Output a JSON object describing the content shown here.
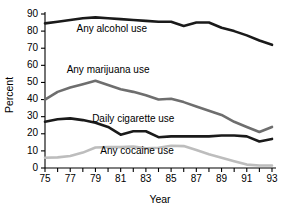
{
  "chart_data": {
    "type": "line",
    "title": "",
    "xlabel": "Year",
    "ylabel": "Percent",
    "xlim": [
      75,
      93
    ],
    "ylim": [
      0,
      90
    ],
    "ytick_labels": [
      "0",
      "10",
      "20",
      "30",
      "40",
      "50",
      "60",
      "70",
      "80",
      "90"
    ],
    "yticks": [
      0,
      10,
      20,
      30,
      40,
      50,
      60,
      70,
      80,
      90
    ],
    "xtick_labels": [
      "75",
      "77",
      "79",
      "81",
      "83",
      "85",
      "87",
      "89",
      "91",
      "93"
    ],
    "xticks": [
      75,
      77,
      79,
      81,
      83,
      85,
      87,
      89,
      91,
      93
    ],
    "xticks_minor": [
      76,
      78,
      80,
      82,
      84,
      86,
      88,
      90,
      92
    ],
    "grid": false,
    "legend_position": "inline-labels",
    "x": [
      75,
      76,
      77,
      78,
      79,
      80,
      81,
      82,
      83,
      84,
      85,
      86,
      87,
      88,
      89,
      90,
      91,
      92,
      93
    ],
    "series": [
      {
        "name": "Any alcohol use",
        "label": "Any alcohol use",
        "color": "#1a1a1a",
        "width": 2.6,
        "label_x": 80.3,
        "label_y": 79.5,
        "values": [
          84.5,
          85.5,
          86.5,
          87.5,
          88.0,
          87.5,
          87.0,
          86.5,
          86.0,
          85.5,
          85.5,
          83.0,
          85.0,
          85.0,
          82.0,
          80.0,
          77.5,
          74.5,
          72.0
        ]
      },
      {
        "name": "Any marijuana use",
        "label": "Any marijuana use",
        "color": "#6e6e6e",
        "width": 2.6,
        "label_x": 80.0,
        "label_y": 55.5,
        "values": [
          40.0,
          44.5,
          47.0,
          49.0,
          51.0,
          48.5,
          46.0,
          44.5,
          42.5,
          40.0,
          40.5,
          38.5,
          36.0,
          33.5,
          31.0,
          27.0,
          24.0,
          21.0,
          24.0
        ]
      },
      {
        "name": "Daily cigarette use",
        "label": "Daily cigarette use",
        "color": "#1a1a1a",
        "width": 2.6,
        "label_x": 82.0,
        "label_y": 27.0,
        "values": [
          27.0,
          28.5,
          29.0,
          28.0,
          26.5,
          24.0,
          19.5,
          21.5,
          21.5,
          18.0,
          18.5,
          18.5,
          18.5,
          18.5,
          19.0,
          19.0,
          18.5,
          15.5,
          17.0
        ]
      },
      {
        "name": "Any cocaine use",
        "label": "Any cocaine use",
        "color": "#bdbdbd",
        "width": 2.6,
        "label_x": 82.3,
        "label_y": 8.0,
        "values": [
          6.0,
          6.2,
          7.0,
          9.0,
          12.0,
          12.2,
          12.2,
          12.5,
          11.5,
          11.8,
          13.0,
          12.8,
          10.5,
          8.0,
          6.0,
          4.0,
          2.0,
          1.5,
          1.5
        ]
      }
    ]
  }
}
